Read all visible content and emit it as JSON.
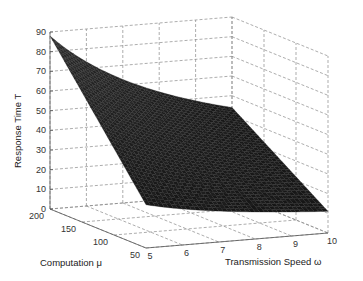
{
  "chart_data": {
    "type": "surface",
    "title": "",
    "xlabel": "Transmission Speed ω",
    "ylabel": "Computation μ",
    "zlabel": "Response Time T",
    "x_ticks": [
      5,
      6,
      7,
      8,
      9,
      10
    ],
    "y_ticks": [
      200,
      150,
      100,
      50
    ],
    "z_ticks": [
      0,
      10,
      20,
      30,
      40,
      50,
      60,
      70,
      80,
      90
    ],
    "xlim": [
      5,
      10
    ],
    "ylim": [
      50,
      200
    ],
    "zlim": [
      0,
      90
    ],
    "grid": true,
    "surface_color": "#1e1e1e",
    "corner_values": [
      {
        "omega": 5,
        "mu": 200,
        "T": 89
      },
      {
        "omega": 10,
        "mu": 200,
        "T": 44
      },
      {
        "omega": 5,
        "mu": 50,
        "T": 22
      },
      {
        "omega": 10,
        "mu": 50,
        "T": 11
      }
    ],
    "omega": [
      5,
      6,
      7,
      8,
      9,
      10
    ],
    "mu": [
      200,
      150,
      100,
      50
    ],
    "T": [
      [
        88,
        73.3,
        62.9,
        55,
        48.9,
        44
      ],
      [
        66,
        55,
        47.1,
        41.3,
        36.7,
        33
      ],
      [
        44,
        36.7,
        31.4,
        27.5,
        24.4,
        22
      ],
      [
        22,
        18.3,
        15.7,
        13.8,
        12.2,
        11
      ]
    ]
  },
  "labels": {
    "z_axis": "Response Time T",
    "y_axis": "Computation μ",
    "x_axis": "Transmission Speed ω",
    "z_ticks": [
      "0",
      "10",
      "20",
      "30",
      "40",
      "50",
      "60",
      "70",
      "80",
      "90"
    ],
    "y_ticks": [
      "200",
      "150",
      "100",
      "50"
    ],
    "x_ticks": [
      "5",
      "6",
      "7",
      "8",
      "9",
      "10"
    ]
  }
}
